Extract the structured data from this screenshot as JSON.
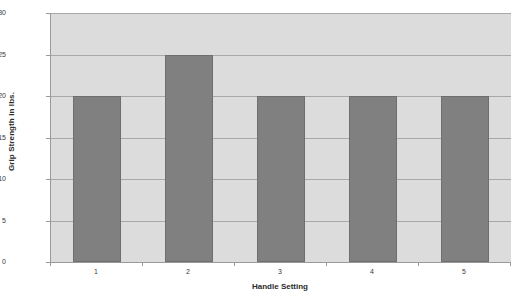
{
  "chart_data": {
    "type": "bar",
    "title": "",
    "categories": [
      "1",
      "2",
      "3",
      "4",
      "5"
    ],
    "values": [
      20,
      25,
      20,
      20,
      20
    ],
    "series": [
      {
        "name": "Grip Strength",
        "values": [
          20,
          25,
          20,
          20,
          20
        ]
      }
    ],
    "xlabel": "Handle Setting",
    "ylabel": "Grip Strength in lbs.",
    "ylim": [
      0,
      30
    ],
    "yticks": [
      0,
      5,
      10,
      15,
      20,
      25,
      30
    ],
    "ytick_labels": [
      "0",
      "5",
      "10",
      "15",
      "20",
      "25",
      "30"
    ],
    "grid": "horizontal",
    "legend": "none",
    "colors": {
      "bar_fill": "#808080",
      "bar_border": "#6e6e6e",
      "plot_background": "#dcdcdc",
      "page_background": "#ffffff",
      "gridline": "#a8a8a8",
      "axis_line": "#9a9a9a",
      "text": "#2b2b2b"
    }
  }
}
